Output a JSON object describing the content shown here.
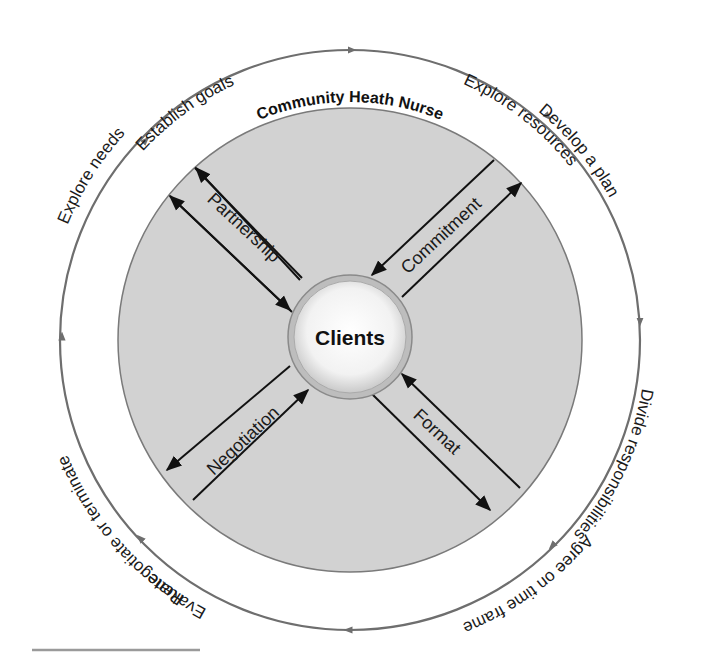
{
  "diagram": {
    "outer_title": "Community Heath Nurse",
    "center_label": "Clients",
    "cycle_steps": [
      {
        "label": "Establish goals"
      },
      {
        "label": "Explore resources"
      },
      {
        "label": "Develop a plan"
      },
      {
        "label": "Divide responsibilities"
      },
      {
        "label": "Agree on time frame"
      },
      {
        "label": "Evaluate"
      },
      {
        "label": "Renegotiate or terminate"
      },
      {
        "label": "Explore needs"
      }
    ],
    "spokes": [
      {
        "label": "Partnership",
        "position": "upper-left"
      },
      {
        "label": "Commitment",
        "position": "upper-right"
      },
      {
        "label": "Format",
        "position": "lower-right"
      },
      {
        "label": "Negotiation",
        "position": "lower-left"
      }
    ],
    "colors": {
      "ring": "#6e6e6e",
      "disc_fill": "#d2d2d2",
      "disc_stroke": "#7a7a7a",
      "spoke_line": "#111111",
      "center_fill": "#f7f7f7"
    }
  }
}
